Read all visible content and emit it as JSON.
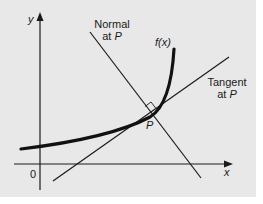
{
  "diagram": {
    "type": "tangent-normal-diagram",
    "axes": {
      "x_label": "x",
      "y_label": "y",
      "origin_label": "0"
    },
    "curve": {
      "label": "f(x)"
    },
    "point": {
      "label": "P"
    },
    "normal": {
      "line1": "Normal",
      "line2_prefix": "at ",
      "line2_point": "P"
    },
    "tangent": {
      "line1": "Tangent",
      "line2_prefix": "at ",
      "line2_point": "P"
    },
    "colors": {
      "background": "#e8e8e8",
      "ink": "#1a1a1a"
    }
  }
}
